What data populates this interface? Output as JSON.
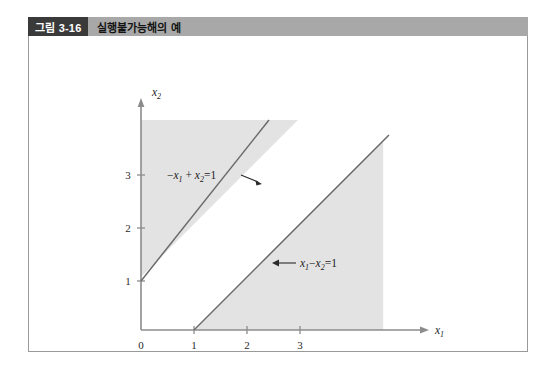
{
  "figure": {
    "number_label": "그림 3-16",
    "caption": "실행불가능해의 예",
    "colors": {
      "caption_bar": "#a8a8a8",
      "number_box": "#3a3a3a",
      "shaded_region": "#e3e3e3",
      "axis": "#8c8c8c",
      "constraint_line": "#6b6b6b",
      "border": "#9a9a9a"
    }
  },
  "chart_data": {
    "type": "line",
    "title": "실행불가능해의 예",
    "xlabel": "x₁",
    "ylabel": "x₂",
    "xlim": [
      0,
      4.6
    ],
    "ylim": [
      0,
      4.5
    ],
    "grid": false,
    "legend": "none",
    "x_ticks": [
      "0",
      "1",
      "2",
      "3"
    ],
    "x_tick_values": [
      0,
      1,
      2,
      3
    ],
    "y_ticks": [
      "1",
      "2",
      "3"
    ],
    "y_tick_values": [
      1,
      2,
      3
    ],
    "series": [
      {
        "name": "-x1 + x2 = 1",
        "label": "−x₁ + x₂ = 1",
        "slope": 1,
        "intercept": 1,
        "x": [
          0,
          3.55
        ],
        "y": [
          1,
          4.55
        ],
        "shaded_side": "above-left"
      },
      {
        "name": "x1 - x2 = 1",
        "label": "x₁ − x₂ = 1",
        "slope": 1,
        "intercept": -1,
        "x": [
          1,
          4.6
        ],
        "y": [
          0,
          3.6
        ],
        "shaded_side": "below-right"
      }
    ],
    "annotations": [
      {
        "text": "−x₁ + x₂ = 1",
        "x": 1.05,
        "y": 3.0,
        "arrow": "right",
        "points_to_series": "-x1 + x2 = 1"
      },
      {
        "text": "x₁ − x₂ = 1",
        "x": 2.6,
        "y": 1.55,
        "arrow": "left",
        "points_to_series": "x1 - x2 = 1"
      }
    ],
    "regions": [
      {
        "name": "infeasible-upper-left",
        "description": "shaded area above and left of the line -x1 + x2 = 1"
      },
      {
        "name": "infeasible-lower-right",
        "description": "shaded area below and right of the line x1 - x2 = 1"
      }
    ]
  },
  "equation_parts": {
    "eq1": {
      "minus": "−",
      "v1": "x",
      "s1": "1",
      "plus": "+",
      "v2": "x",
      "s2": "2",
      "eq": "=",
      "rhs": "1"
    },
    "eq2": {
      "v1": "x",
      "s1": "1",
      "minus": "−",
      "v2": "x",
      "s2": "2",
      "eq": "=",
      "rhs": "1"
    }
  },
  "axis_names": {
    "x": "x",
    "x_sub": "1",
    "y": "x",
    "y_sub": "2"
  }
}
